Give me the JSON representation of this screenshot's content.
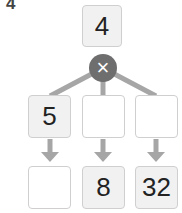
{
  "question_number": "4",
  "top": {
    "value": "4"
  },
  "operator": {
    "symbol": "×",
    "name": "multiply"
  },
  "middle_row": [
    {
      "value": "5"
    },
    {
      "value": ""
    },
    {
      "value": ""
    }
  ],
  "bottom_row": [
    {
      "value": ""
    },
    {
      "value": "8"
    },
    {
      "value": "32"
    }
  ],
  "colors": {
    "line": "#a6a6a6",
    "operator_bg": "#6e6e6e",
    "filled_box": "#f1f1f1",
    "border": "#cfcfcf"
  }
}
